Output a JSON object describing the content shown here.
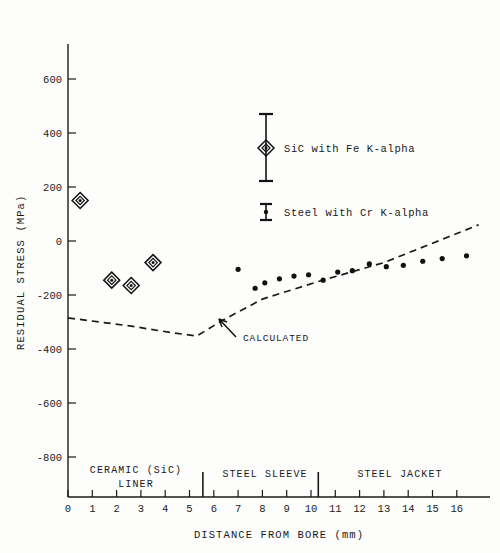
{
  "chart_data": {
    "type": "scatter",
    "title": "",
    "xlabel": "DISTANCE FROM BORE (mm)",
    "ylabel": "RESIDUAL STRESS (MPa)",
    "xlim": [
      0,
      17.2
    ],
    "ylim": [
      -900,
      700
    ],
    "xticks": [
      0,
      1,
      2,
      3,
      4,
      5,
      6,
      7,
      8,
      9,
      10,
      11,
      12,
      13,
      14,
      15,
      16
    ],
    "xticklabels": [
      "0",
      "1",
      "2",
      "3",
      "4",
      "5",
      "6",
      "7",
      "8",
      "9",
      "10",
      "11",
      "12",
      "13",
      "14",
      "15",
      "16"
    ],
    "yticks": [
      600,
      400,
      200,
      0,
      -200,
      -400,
      -600,
      -800
    ],
    "yticklabels": [
      "600",
      "400",
      "200",
      "0",
      "-200",
      "-400",
      "-600",
      "-800"
    ],
    "grid": false,
    "legend_position": "upper center inside",
    "series": [
      {
        "name": "SiC with Fe K-alpha",
        "marker": "diamond",
        "points": [
          {
            "x": 0.5,
            "y": 150
          },
          {
            "x": 1.8,
            "y": -145
          },
          {
            "x": 2.6,
            "y": -165
          },
          {
            "x": 3.5,
            "y": -80
          }
        ]
      },
      {
        "name": "Steel with Cr K-alpha",
        "marker": "dot",
        "points": [
          {
            "x": 7.0,
            "y": -105
          },
          {
            "x": 7.7,
            "y": -175
          },
          {
            "x": 8.1,
            "y": -155
          },
          {
            "x": 8.7,
            "y": -140
          },
          {
            "x": 9.3,
            "y": -130
          },
          {
            "x": 9.9,
            "y": -125
          },
          {
            "x": 10.5,
            "y": -145
          },
          {
            "x": 11.1,
            "y": -115
          },
          {
            "x": 11.7,
            "y": -110
          },
          {
            "x": 12.4,
            "y": -85
          },
          {
            "x": 13.1,
            "y": -95
          },
          {
            "x": 13.8,
            "y": -90
          },
          {
            "x": 14.6,
            "y": -75
          },
          {
            "x": 15.4,
            "y": -65
          },
          {
            "x": 16.4,
            "y": -55
          }
        ]
      }
    ],
    "calculated_curve": {
      "name": "CALCULATED",
      "style": "dashed",
      "points": [
        {
          "x": 0.0,
          "y": -285
        },
        {
          "x": 2.6,
          "y": -315
        },
        {
          "x": 4.3,
          "y": -340
        },
        {
          "x": 5.3,
          "y": -352
        },
        {
          "x": 6.4,
          "y": -292
        },
        {
          "x": 8.0,
          "y": -215
        },
        {
          "x": 10.3,
          "y": -150
        },
        {
          "x": 13.0,
          "y": -80
        },
        {
          "x": 16.9,
          "y": 60
        }
      ]
    },
    "annotations": [
      {
        "name": "calculated-label",
        "text": "CALCULATED"
      }
    ],
    "regions": [
      {
        "name": "ceramic-liner",
        "line1": "CERAMIC (SiC)",
        "line2": "LINER",
        "x_start": 0,
        "x_end": 5.55
      },
      {
        "name": "steel-sleeve",
        "line1": "STEEL SLEEVE",
        "line2": "",
        "x_start": 5.55,
        "x_end": 10.3
      },
      {
        "name": "steel-jacket",
        "line1": "STEEL JACKET",
        "line2": "",
        "x_start": 10.3,
        "x_end": 17.2
      }
    ],
    "region_boundaries": [
      5.55,
      10.3
    ],
    "legend": [
      {
        "name": "sic-fe",
        "label": "SiC with Fe K-alpha",
        "marker": "diamond",
        "error_bar": true,
        "error_low": 245,
        "error_high": 450
      },
      {
        "name": "steel-cr",
        "label": "Steel with Cr K-alpha",
        "marker": "dot",
        "error_bar": true,
        "error_low": 185,
        "error_high": 230
      }
    ],
    "colors": {
      "ink": "#1a1a1a",
      "background": "#fdfdfc"
    }
  }
}
